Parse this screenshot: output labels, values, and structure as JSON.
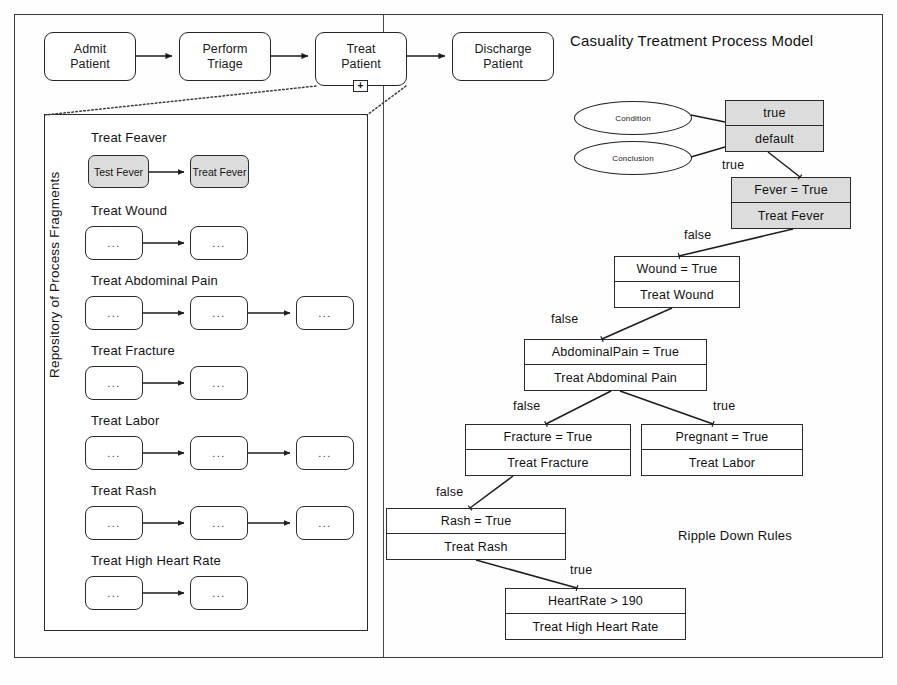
{
  "diagram": {
    "model_title": "Casuality Treatment Process Model",
    "rdr_caption": "Ripple Down Rules",
    "repository_label": "Repository of Process Fragments"
  },
  "process": {
    "tasks": [
      {
        "id": "admit",
        "line1": "Admit",
        "line2": "Patient"
      },
      {
        "id": "triage",
        "line1": "Perform",
        "line2": "Triage"
      },
      {
        "id": "treat",
        "line1": "Treat",
        "line2": "Patient",
        "marker": "+"
      },
      {
        "id": "discharge",
        "line1": "Discharge",
        "line2": "Patient"
      }
    ]
  },
  "fragments": [
    {
      "title": "Treat Feaver",
      "shaded": true,
      "tasks": [
        {
          "line1": "Test",
          "line2": "Fever"
        },
        {
          "line1": "Treat",
          "line2": "Fever"
        }
      ]
    },
    {
      "title": "Treat Wound",
      "shaded": false,
      "tasks": [
        {
          "line1": "...",
          "line2": ""
        },
        {
          "line1": "...",
          "line2": ""
        }
      ]
    },
    {
      "title": "Treat Abdominal Pain",
      "shaded": false,
      "tasks": [
        {
          "line1": "...",
          "line2": ""
        },
        {
          "line1": "...",
          "line2": ""
        },
        {
          "line1": "...",
          "line2": ""
        }
      ]
    },
    {
      "title": "Treat Fracture",
      "shaded": false,
      "tasks": [
        {
          "line1": "...",
          "line2": ""
        },
        {
          "line1": "...",
          "line2": ""
        }
      ]
    },
    {
      "title": "Treat Labor",
      "shaded": false,
      "tasks": [
        {
          "line1": "...",
          "line2": ""
        },
        {
          "line1": "...",
          "line2": ""
        },
        {
          "line1": "...",
          "line2": ""
        }
      ]
    },
    {
      "title": "Treat Rash",
      "shaded": false,
      "tasks": [
        {
          "line1": "...",
          "line2": ""
        },
        {
          "line1": "...",
          "line2": ""
        },
        {
          "line1": "...",
          "line2": ""
        }
      ]
    },
    {
      "title": "Treat High Heart Rate",
      "shaded": false,
      "tasks": [
        {
          "line1": "...",
          "line2": ""
        },
        {
          "line1": "...",
          "line2": ""
        }
      ]
    }
  ],
  "legend": {
    "condition": "Condition",
    "conclusion": "Conclusion"
  },
  "rules": [
    {
      "id": "root",
      "condition": "true",
      "conclusion": "default",
      "shaded": true
    },
    {
      "id": "fever",
      "condition": "Fever = True",
      "conclusion": "Treat Fever",
      "shaded": true
    },
    {
      "id": "wound",
      "condition": "Wound  = True",
      "conclusion": "Treat Wound",
      "shaded": false
    },
    {
      "id": "abdominal",
      "condition": "AbdominalPain  = True",
      "conclusion": "Treat Abdominal Pain",
      "shaded": false
    },
    {
      "id": "fracture",
      "condition": "Fracture  = True",
      "conclusion": "Treat Fracture",
      "shaded": false
    },
    {
      "id": "pregnant",
      "condition": "Pregnant  = True",
      "conclusion": "Treat Labor",
      "shaded": false
    },
    {
      "id": "rash",
      "condition": "Rash  = True",
      "conclusion": "Treat Rash",
      "shaded": false
    },
    {
      "id": "heartrate",
      "condition": "HeartRate  > 190",
      "conclusion": "Treat High Heart Rate",
      "shaded": false
    }
  ],
  "edge_labels": {
    "root_true": "true",
    "fever_false": "false",
    "wound_false": "false",
    "abdominal_false": "false",
    "abdominal_true": "true",
    "fracture_false": "false",
    "rash_true": "true"
  },
  "colors": {
    "stroke": "#2a2a2a",
    "shade_fill": "#dcdcdc",
    "background": "#ffffff"
  }
}
